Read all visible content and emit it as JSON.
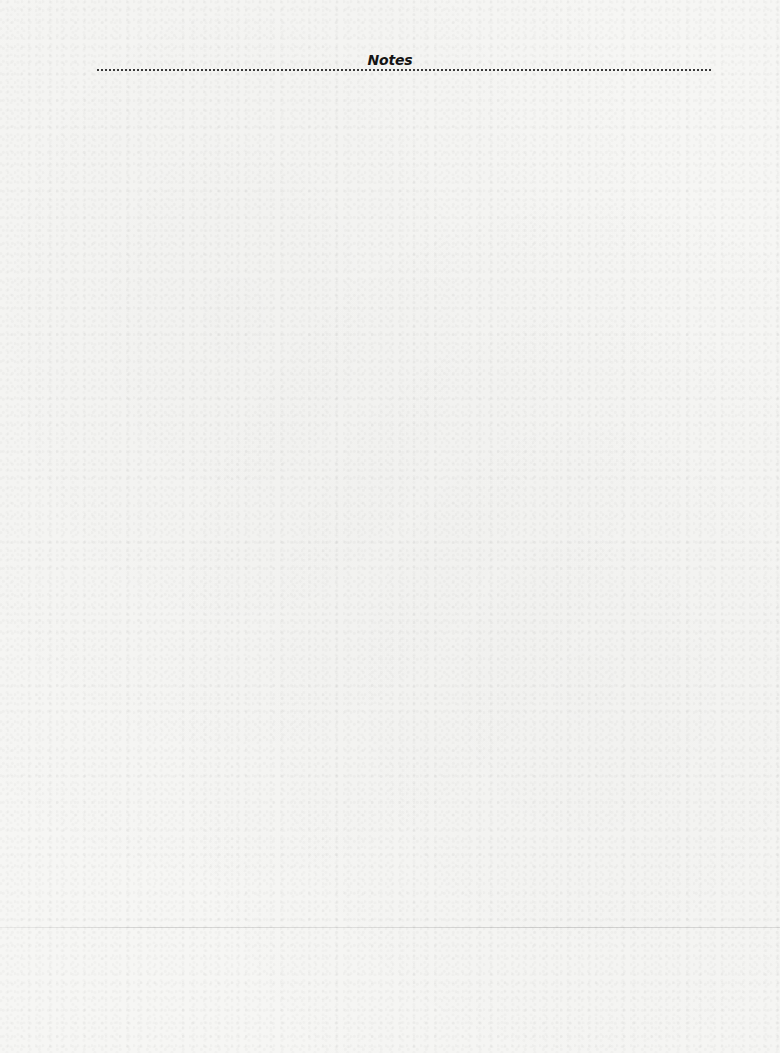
{
  "page": {
    "title": "Notes",
    "background_color": "#f6f6f4",
    "text_color": "#141414",
    "rule_style": "dotted"
  },
  "notes": {
    "content": ""
  }
}
